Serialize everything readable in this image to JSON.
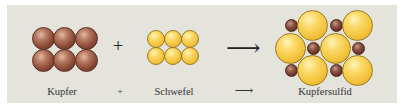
{
  "diagram": {
    "reactants": [
      {
        "name": "Kupfer",
        "color": "#8a4a37",
        "particles": 6
      },
      {
        "name": "Schwefel",
        "color": "#f2c23a",
        "particles": 6
      }
    ],
    "product": {
      "name": "Kupfersulfid",
      "large_particles_sulfur": 6,
      "small_particles_copper": 6
    },
    "operators": {
      "plus": "+",
      "arrow": "⟶"
    },
    "labels": {
      "kupfer": "Kupfer",
      "plus": "+",
      "schwefel": "Schwefel",
      "arrow": "⟶",
      "kupfersulfid": "Kupfersulfid"
    },
    "colors": {
      "background": "#e4e3dc",
      "copper": "#8a4a37",
      "sulfur": "#f2c23a"
    }
  }
}
